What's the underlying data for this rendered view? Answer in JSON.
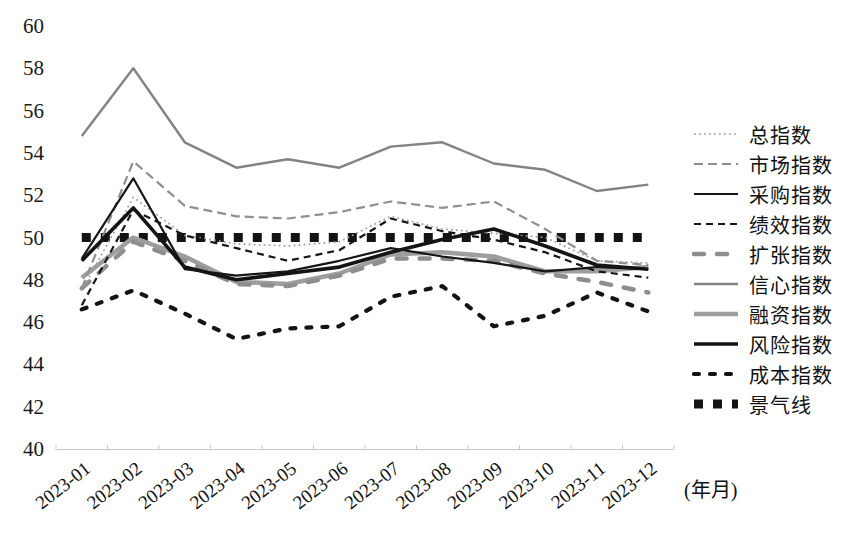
{
  "chart_data": {
    "type": "line",
    "title": "",
    "xlabel": "(年月)",
    "ylabel": "",
    "ylim": [
      40,
      60
    ],
    "yticks": [
      60,
      58,
      56,
      54,
      52,
      50,
      48,
      46,
      44,
      42,
      40
    ],
    "grid": false,
    "legend_position": "right",
    "categories": [
      "2023-01",
      "2023-02",
      "2023-03",
      "2023-04",
      "2023-05",
      "2023-06",
      "2023-07",
      "2023-08",
      "2023-09",
      "2023-10",
      "2023-11",
      "2023-12"
    ],
    "series": [
      {
        "name": "总指数",
        "values": [
          47.5,
          51.9,
          50.1,
          49.7,
          49.6,
          49.8,
          51.0,
          50.4,
          50.2,
          50.0,
          48.9,
          48.8
        ],
        "color": "#9f9f9f",
        "width": 1.7,
        "dash": "1.8 3.2",
        "cap": "butt"
      },
      {
        "name": "市场指数",
        "values": [
          47.6,
          53.6,
          51.5,
          51.0,
          50.9,
          51.2,
          51.7,
          51.4,
          51.7,
          50.4,
          48.9,
          48.7
        ],
        "color": "#8f8f8f",
        "width": 2.2,
        "dash": "9 5",
        "cap": "butt"
      },
      {
        "name": "采购指数",
        "values": [
          49.0,
          52.8,
          48.5,
          48.2,
          48.4,
          48.9,
          49.5,
          49.1,
          48.8,
          48.4,
          48.6,
          48.5
        ],
        "color": "#161616",
        "width": 2.2,
        "dash": "",
        "cap": "butt"
      },
      {
        "name": "绩效指数",
        "values": [
          46.8,
          51.3,
          50.1,
          49.5,
          48.9,
          49.4,
          50.9,
          50.3,
          49.9,
          49.3,
          48.4,
          48.1
        ],
        "color": "#161616",
        "width": 2.2,
        "dash": "7 5",
        "cap": "butt"
      },
      {
        "name": "扩张指数",
        "values": [
          47.6,
          49.8,
          48.9,
          47.8,
          47.7,
          48.2,
          49.0,
          49.0,
          48.9,
          48.3,
          47.9,
          47.4
        ],
        "color": "#8e8e8e",
        "width": 4.5,
        "dash": "10 13",
        "cap": "round"
      },
      {
        "name": "信心指数",
        "values": [
          54.8,
          58.0,
          54.5,
          53.3,
          53.7,
          53.3,
          54.3,
          54.5,
          53.5,
          53.2,
          52.2,
          52.5
        ],
        "color": "#838383",
        "width": 2.4,
        "dash": "",
        "cap": "butt"
      },
      {
        "name": "融资指数",
        "values": [
          48.1,
          50.0,
          49.1,
          47.9,
          47.8,
          48.3,
          49.2,
          49.3,
          49.1,
          48.4,
          48.4,
          48.6
        ],
        "color": "#9e9e9e",
        "width": 4.5,
        "dash": "",
        "cap": "butt"
      },
      {
        "name": "风险指数",
        "values": [
          48.9,
          51.4,
          48.6,
          48.0,
          48.3,
          48.6,
          49.3,
          49.9,
          50.4,
          49.6,
          48.7,
          48.5
        ],
        "color": "#141414",
        "width": 3.6,
        "dash": "",
        "cap": "butt"
      },
      {
        "name": "成本指数",
        "values": [
          46.6,
          47.5,
          46.4,
          45.2,
          45.7,
          45.8,
          47.2,
          47.7,
          45.8,
          46.3,
          47.4,
          46.5
        ],
        "color": "#141414",
        "width": 4.2,
        "dash": "5 11",
        "cap": "round"
      },
      {
        "name": "景气线",
        "values": [
          50,
          50,
          50,
          50,
          50,
          50,
          50,
          50,
          50,
          50,
          50,
          50
        ],
        "color": "#131313",
        "width": 9,
        "dash": "9 10",
        "cap": "butt"
      }
    ]
  }
}
